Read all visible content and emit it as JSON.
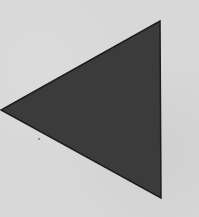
{
  "image": {
    "width": 199,
    "height": 217,
    "background_color": "#d8d8d8"
  },
  "shape": {
    "type": "triangle",
    "direction": "left",
    "icon": "triangle-left-icon",
    "fill_color": "#3b3b3b",
    "stroke_color": "#1c1c1c",
    "stroke_width": 1.5,
    "points": [
      [
        160,
        21
      ],
      [
        161,
        198
      ],
      [
        1,
        110
      ]
    ]
  },
  "speck": {
    "x": 39,
    "y": 139,
    "r": 1,
    "color": "#7a7a7a"
  }
}
